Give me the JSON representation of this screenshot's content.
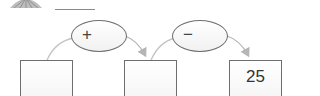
{
  "header": {
    "decorative_icon": "fan-shell-icon",
    "answer_blank": ""
  },
  "diagram": {
    "operations": [
      {
        "symbol": "+",
        "name": "plus"
      },
      {
        "symbol": "−",
        "name": "minus"
      }
    ],
    "boxes": [
      {
        "value": ""
      },
      {
        "value": ""
      },
      {
        "value": "25"
      }
    ],
    "colors": {
      "stroke": "#6e6e6e",
      "arrow": "#b5b5b5",
      "text": "#333333"
    }
  }
}
